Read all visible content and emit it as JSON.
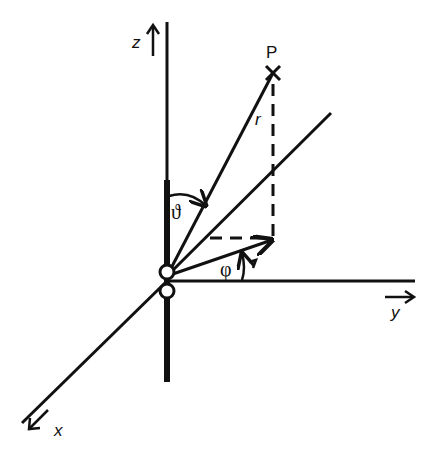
{
  "diagram": {
    "labels": {
      "z_axis": "z",
      "y_axis": "y",
      "x_axis": "x",
      "point": "P",
      "radius": "r",
      "polar_angle": "ϑ",
      "azimuth_angle": "φ"
    },
    "colors": {
      "stroke": "#111111",
      "background": "#ffffff"
    }
  }
}
